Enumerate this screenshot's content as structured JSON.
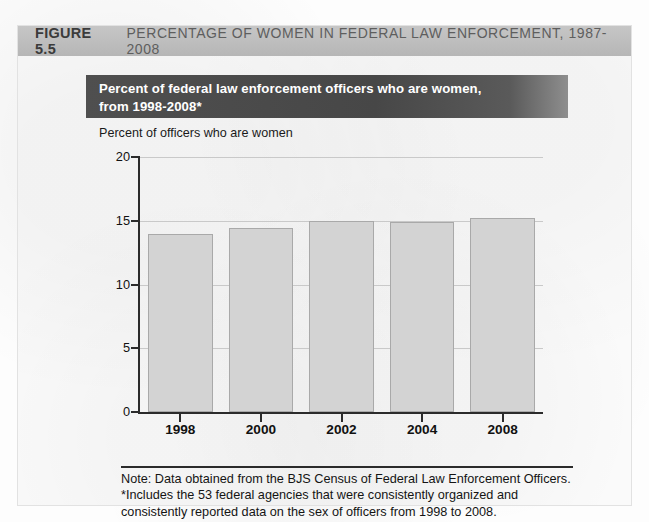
{
  "figure": {
    "number": "FIGURE 5.5",
    "caption": "PERCENTAGE OF WOMEN IN FEDERAL LAW ENFORCEMENT, 1987-2008"
  },
  "chart_title": {
    "line1": "Percent of federal law enforcement officers who are women,",
    "line2": "from 1998-2008*"
  },
  "footnote": {
    "line1": "Note: Data obtained from the BJS Census of Federal Law Enforcement Officers.",
    "line2": "*Includes the 53 federal agencies that were consistently organized and",
    "line3": "consistently reported data on the sex of officers from 1998 to 2008."
  },
  "colors": {
    "header_band": "#bdbdbd",
    "title_band": "#4f4f4f",
    "bar_fill": "#d3d3d3",
    "bar_stroke": "#a9a9a9",
    "axis": "#2b2b2b",
    "gridline": "#c9c9c9"
  },
  "chart_data": {
    "type": "bar",
    "title": "Percent of federal law enforcement officers who are women, from 1998-2008*",
    "xlabel": "",
    "ylabel": "Percent of officers who are women",
    "categories": [
      "1998",
      "2000",
      "2002",
      "2004",
      "2008"
    ],
    "values": [
      14.0,
      14.4,
      15.0,
      14.9,
      15.2
    ],
    "ylim": [
      0,
      20
    ],
    "yticks": [
      0,
      5,
      10,
      15,
      20
    ],
    "ytick_labels": [
      "0",
      "5",
      "10",
      "15",
      "20"
    ],
    "grid": true,
    "legend": "none",
    "series": [
      {
        "name": "Percent of federal law enforcement officers who are women",
        "values": [
          14.0,
          14.4,
          15.0,
          14.9,
          15.2
        ]
      }
    ]
  }
}
